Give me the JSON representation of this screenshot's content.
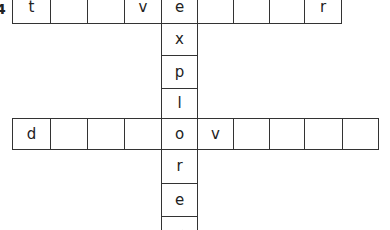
{
  "puzzle": {
    "clue_number": "4",
    "across_top": {
      "cells": [
        "t",
        "",
        "",
        "v",
        "e",
        "",
        "",
        "",
        "r"
      ]
    },
    "down": {
      "cells": [
        "e",
        "x",
        "p",
        "l",
        "o",
        "r",
        "e",
        "r"
      ]
    },
    "across_bottom": {
      "cells": [
        "d",
        "",
        "",
        "",
        "o",
        "v",
        "",
        "",
        "",
        ""
      ]
    }
  }
}
